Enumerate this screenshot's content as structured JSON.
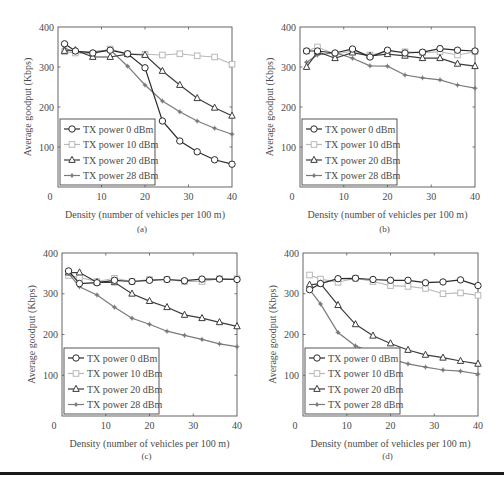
{
  "figure": {
    "rule_color": "#1a1a1a"
  },
  "legend_labels": [
    "TX power 0 dBm",
    "TX power 10 dBm",
    "TX power 20 dBm",
    "TX power 28 dBm"
  ],
  "series_style": [
    {
      "name": "TX power 0 dBm",
      "color": "#2a2a2a",
      "marker": "circle"
    },
    {
      "name": "TX power 10 dBm",
      "color": "#b8b8b8",
      "marker": "square"
    },
    {
      "name": "TX power 20 dBm",
      "color": "#3c3c3c",
      "marker": "triangle"
    },
    {
      "name": "TX power 28 dBm",
      "color": "#7a7a7a",
      "marker": "star"
    }
  ],
  "chart_data": [
    {
      "type": "line",
      "panel_label": "(a)",
      "title": "",
      "xlabel": "Density (number of vehicles per 100 m)",
      "ylabel": "Average goodput (Kbps)",
      "xlim": [
        0,
        40
      ],
      "ylim": [
        0,
        400
      ],
      "xticks": [
        0,
        10,
        20,
        30,
        40
      ],
      "yticks": [
        100,
        200,
        300,
        400
      ],
      "grid": false,
      "legend_position": "lower left",
      "x": [
        1.5,
        4,
        8,
        12,
        16,
        20,
        24,
        28,
        32,
        36,
        40
      ],
      "series": [
        {
          "name": "TX power 0 dBm",
          "values": [
            358,
            340,
            335,
            342,
            333,
            298,
            165,
            115,
            88,
            68,
            57
          ]
        },
        {
          "name": "TX power 10 dBm",
          "values": [
            338,
            335,
            333,
            345,
            333,
            332,
            330,
            333,
            328,
            325,
            307
          ]
        },
        {
          "name": "TX power 20 dBm",
          "values": [
            340,
            342,
            325,
            325,
            332,
            330,
            290,
            255,
            222,
            198,
            178
          ]
        },
        {
          "name": "TX power 28 dBm",
          "values": [
            347,
            338,
            338,
            343,
            302,
            255,
            215,
            188,
            165,
            147,
            132
          ]
        }
      ]
    },
    {
      "type": "line",
      "panel_label": "(b)",
      "title": "",
      "xlabel": "Density (number of vehicles per 100 m)",
      "ylabel": "Average goodput (Kbps)",
      "xlim": [
        0,
        40
      ],
      "ylim": [
        0,
        400
      ],
      "xticks": [
        0,
        10,
        20,
        30,
        40
      ],
      "yticks": [
        100,
        200,
        300,
        400
      ],
      "grid": false,
      "legend_position": "lower left",
      "x": [
        1.5,
        4,
        8,
        12,
        16,
        20,
        24,
        28,
        32,
        36,
        40
      ],
      "series": [
        {
          "name": "TX power 0 dBm",
          "values": [
            340,
            340,
            335,
            345,
            325,
            342,
            335,
            337,
            346,
            342,
            340
          ]
        },
        {
          "name": "TX power 10 dBm",
          "values": [
            340,
            350,
            332,
            340,
            330,
            338,
            338,
            336,
            338,
            330,
            338
          ]
        },
        {
          "name": "TX power 20 dBm",
          "values": [
            300,
            338,
            322,
            336,
            328,
            332,
            328,
            322,
            322,
            308,
            302
          ]
        },
        {
          "name": "TX power 28 dBm",
          "values": [
            312,
            330,
            336,
            322,
            303,
            302,
            280,
            273,
            268,
            255,
            247
          ]
        }
      ]
    },
    {
      "type": "line",
      "panel_label": "(c)",
      "title": "",
      "xlabel": "Density (number of vehicles per 100 m)",
      "ylabel": "Average goodput (Kbps)",
      "xlim": [
        0,
        40
      ],
      "ylim": [
        0,
        400
      ],
      "xticks": [
        0,
        10,
        20,
        30,
        40
      ],
      "yticks": [
        100,
        200,
        300,
        400
      ],
      "grid": false,
      "legend_position": "lower left",
      "x": [
        1.5,
        4,
        8,
        12,
        16,
        20,
        24,
        28,
        32,
        36,
        40
      ],
      "series": [
        {
          "name": "TX power 0 dBm",
          "values": [
            356,
            325,
            327,
            333,
            330,
            333,
            335,
            332,
            336,
            336,
            335
          ]
        },
        {
          "name": "TX power 10 dBm",
          "values": [
            345,
            340,
            330,
            338,
            330,
            335,
            335,
            330,
            330,
            337,
            337
          ]
        },
        {
          "name": "TX power 20 dBm",
          "values": [
            352,
            352,
            328,
            328,
            300,
            282,
            267,
            248,
            240,
            230,
            220
          ]
        },
        {
          "name": "TX power 28 dBm",
          "values": [
            350,
            317,
            297,
            267,
            240,
            225,
            208,
            198,
            188,
            177,
            170
          ]
        }
      ]
    },
    {
      "type": "line",
      "panel_label": "(d)",
      "title": "",
      "xlabel": "Density (number of vehicles per 100 m)",
      "ylabel": "Average goodput (Kbps)",
      "xlim": [
        0,
        40
      ],
      "ylim": [
        0,
        400
      ],
      "xticks": [
        0,
        10,
        20,
        30,
        40
      ],
      "yticks": [
        100,
        200,
        300,
        400
      ],
      "grid": false,
      "legend_position": "lower left",
      "x": [
        1.5,
        4,
        8,
        12,
        16,
        20,
        24,
        28,
        32,
        36,
        40
      ],
      "series": [
        {
          "name": "TX power 0 dBm",
          "values": [
            310,
            325,
            337,
            338,
            335,
            333,
            333,
            327,
            329,
            334,
            320
          ]
        },
        {
          "name": "TX power 10 dBm",
          "values": [
            346,
            336,
            328,
            338,
            330,
            320,
            318,
            313,
            300,
            302,
            296
          ]
        },
        {
          "name": "TX power 20 dBm",
          "values": [
            322,
            325,
            272,
            225,
            197,
            178,
            162,
            150,
            143,
            135,
            128
          ]
        },
        {
          "name": "TX power 28 dBm",
          "values": [
            310,
            275,
            205,
            172,
            155,
            140,
            128,
            120,
            113,
            110,
            103
          ]
        }
      ]
    }
  ]
}
